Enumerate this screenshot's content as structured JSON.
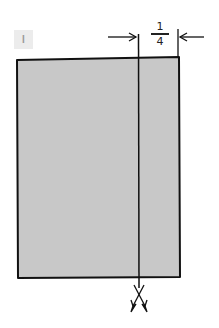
{
  "diagram": {
    "step_label": "I",
    "dimension": {
      "numerator": "1",
      "denominator": "4",
      "fraction": "1/4"
    },
    "panel": {
      "fill": "#c8c8c8",
      "stroke": "#111111"
    },
    "cut_line": {
      "description": "vertical cut line with scissors at bottom",
      "icon": "scissors-icon"
    }
  }
}
